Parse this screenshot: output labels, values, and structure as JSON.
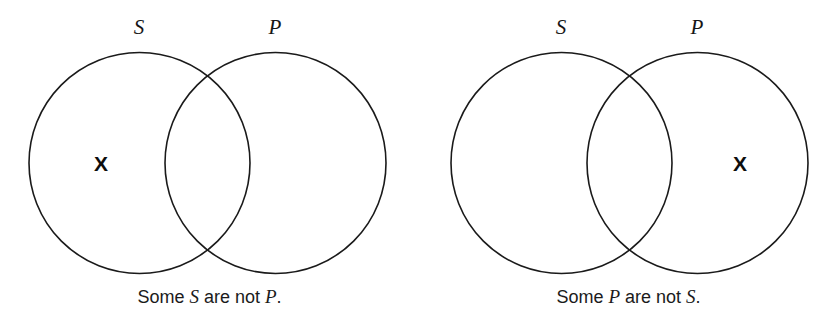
{
  "figure": {
    "background_color": "#ffffff",
    "stroke_color": "#1a1a1a",
    "text_color": "#1b1b1b",
    "diagrams": [
      {
        "id": "some-s-are-not-p",
        "left_circle_label": "S",
        "right_circle_label": "P",
        "x_mark": "X",
        "x_mark_region": "S-only",
        "caption_prefix": "Some ",
        "caption_subject": "S",
        "caption_middle": " are not ",
        "caption_predicate": "P",
        "caption_suffix": ".",
        "caption_full": "Some S are not P."
      },
      {
        "id": "some-p-are-not-s",
        "left_circle_label": "S",
        "right_circle_label": "P",
        "x_mark": "X",
        "x_mark_region": "P-only",
        "caption_prefix": "Some ",
        "caption_subject": "P",
        "caption_middle": " are not ",
        "caption_predicate": "S",
        "caption_suffix": ".",
        "caption_full": "Some P are not S."
      }
    ]
  }
}
